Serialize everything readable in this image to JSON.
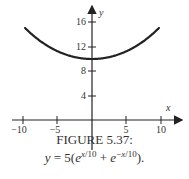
{
  "figure": {
    "caption_title": "FIGURE 5.37:",
    "caption_formula": "y = 5(e^{x/10} + e^{-x/10})."
  },
  "chart_data": {
    "type": "line",
    "xlabel": "x",
    "ylabel": "y",
    "xlim": [
      -10,
      10
    ],
    "ylim": [
      0,
      18
    ],
    "x_ticks": [
      -10,
      -5,
      5,
      10
    ],
    "y_ticks": [
      4,
      8,
      12,
      16
    ],
    "grid": false,
    "legend": null,
    "series": [
      {
        "name": "y = 5(e^(x/10) + e^(-x/10))",
        "x": [
          -9.7,
          -8,
          -6,
          -4,
          -2,
          0,
          2,
          4,
          6,
          8,
          9.7
        ],
        "values": [
          14.96,
          13.37,
          11.86,
          10.81,
          10.2,
          10.0,
          10.2,
          10.81,
          11.86,
          13.37,
          14.96
        ]
      }
    ]
  },
  "labels": {
    "x_axis": "x",
    "y_axis": "y",
    "x_ticks": [
      "−10",
      "−5",
      "5",
      "10"
    ],
    "y_ticks": [
      "16",
      "12",
      "8",
      "4"
    ]
  }
}
